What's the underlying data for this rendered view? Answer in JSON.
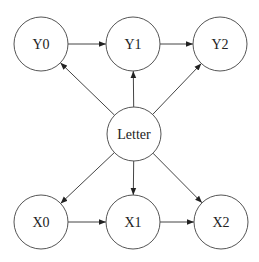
{
  "diagram": {
    "type": "directed-graph",
    "nodes": [
      {
        "id": "Y0",
        "label": "Y0",
        "cx": 41,
        "cy": 44
      },
      {
        "id": "Y1",
        "label": "Y1",
        "cx": 133,
        "cy": 44
      },
      {
        "id": "Y2",
        "label": "Y2",
        "cx": 220,
        "cy": 44
      },
      {
        "id": "Letter",
        "label": "Letter",
        "cx": 134,
        "cy": 134
      },
      {
        "id": "X0",
        "label": "X0",
        "cx": 41,
        "cy": 222
      },
      {
        "id": "X1",
        "label": "X1",
        "cx": 133,
        "cy": 222
      },
      {
        "id": "X2",
        "label": "X2",
        "cx": 221,
        "cy": 222
      }
    ],
    "edges": [
      {
        "from": "Y0",
        "to": "Y1"
      },
      {
        "from": "Y1",
        "to": "Y2"
      },
      {
        "from": "Letter",
        "to": "Y0"
      },
      {
        "from": "Letter",
        "to": "Y1"
      },
      {
        "from": "Letter",
        "to": "Y2"
      },
      {
        "from": "Letter",
        "to": "X0"
      },
      {
        "from": "Letter",
        "to": "X1"
      },
      {
        "from": "Letter",
        "to": "X2"
      },
      {
        "from": "X0",
        "to": "X1"
      },
      {
        "from": "X1",
        "to": "X2"
      }
    ]
  }
}
